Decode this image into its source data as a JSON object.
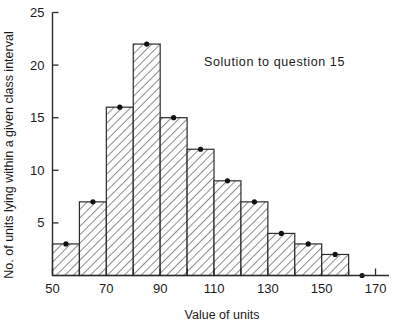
{
  "chart_data": {
    "type": "bar",
    "title": "",
    "annotation": "Solution to question 15",
    "xlabel": "Value of units",
    "ylabel": "No. of units lying within a given class interval",
    "categories": [
      "50-60",
      "60-70",
      "70-80",
      "80-90",
      "90-100",
      "100-110",
      "110-120",
      "120-130",
      "130-140",
      "140-150",
      "150-160"
    ],
    "bin_edges": [
      50,
      60,
      70,
      80,
      90,
      100,
      110,
      120,
      130,
      140,
      150,
      160
    ],
    "bin_midpoints": [
      55,
      65,
      75,
      85,
      95,
      105,
      115,
      125,
      135,
      145,
      155
    ],
    "values": [
      3,
      7,
      16,
      22,
      15,
      12,
      9,
      7,
      4,
      3,
      2
    ],
    "extra_points": [
      {
        "x": 165,
        "y": 0
      }
    ],
    "xlim": [
      50,
      175
    ],
    "ylim": [
      0,
      25
    ],
    "x_ticks": [
      50,
      60,
      70,
      80,
      90,
      100,
      110,
      120,
      130,
      140,
      150,
      160,
      170
    ],
    "x_tick_labels": [
      "50",
      "",
      "70",
      "",
      "90",
      "",
      "110",
      "",
      "130",
      "",
      "150",
      "",
      "170"
    ],
    "y_ticks": [
      5,
      10,
      15,
      20,
      25
    ],
    "y_tick_labels": [
      "5",
      "10",
      "15",
      "20",
      "25"
    ],
    "grid": false,
    "legend": "none",
    "bar_fill": "diagonal-hatch",
    "marker_style": "filled-dot-at-bin-midpoint-top",
    "axis_color": "#2b2b2b",
    "hatch_color": "#6e6e6e"
  },
  "labels": {
    "y_axis_title": "No. of units lying within a given class interval",
    "x_axis_title": "Value of units",
    "annotation": "Solution to question 15"
  }
}
